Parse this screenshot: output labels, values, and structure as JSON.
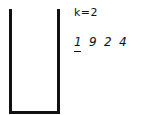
{
  "diagram": {
    "container": {
      "type": "stack",
      "open_top": true,
      "contents": []
    },
    "k_label": "k=2",
    "sequence": [
      "1",
      "9",
      "2",
      "4"
    ],
    "current_index": 0
  }
}
